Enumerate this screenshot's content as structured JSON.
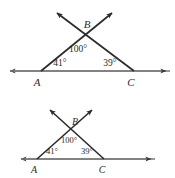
{
  "figures": [
    {
      "id": "figure-top",
      "name": "triangle-abc-large",
      "scale": "large",
      "vertices": {
        "A": "A",
        "B": "B",
        "C": "C"
      },
      "angles": {
        "at_A": "41°",
        "at_B": "100°",
        "at_C": "39°"
      },
      "geometry": {
        "A": [
          41,
          71
        ],
        "B": [
          85,
          33
        ],
        "C": [
          134,
          71
        ],
        "base_left_arrow_end": [
          6,
          71
        ],
        "base_right_arrow_end": [
          170,
          71
        ],
        "ray_up_left_end": [
          53,
          9
        ],
        "ray_up_right_end": [
          116,
          9
        ]
      },
      "label_positions": {
        "A": [
          37,
          85
        ],
        "B": [
          86,
          29
        ],
        "C": [
          130,
          85
        ],
        "angle_A": [
          58,
          64
        ],
        "angle_B": [
          75,
          52
        ],
        "angle_C": [
          108,
          64
        ]
      }
    },
    {
      "id": "figure-bottom",
      "name": "triangle-abc-small",
      "scale": "small",
      "vertices": {
        "A": "A",
        "B": "B",
        "C": "C"
      },
      "angles": {
        "at_A": "41°",
        "at_B": "100°",
        "at_C": "39°"
      },
      "geometry": {
        "A": [
          37,
          70
        ],
        "B": [
          72,
          41
        ],
        "C": [
          104,
          70
        ],
        "base_left_arrow_end": [
          17,
          70
        ],
        "base_right_arrow_end": [
          155,
          70
        ],
        "ray_up_left_end": [
          47,
          17
        ],
        "ray_up_right_end": [
          95,
          17
        ]
      },
      "label_positions": {
        "A": [
          34,
          83
        ],
        "B": [
          74,
          37
        ],
        "C": [
          101,
          83
        ],
        "angle_A": [
          51,
          63
        ],
        "angle_B": [
          66,
          53
        ],
        "angle_C": [
          85,
          63
        ]
      }
    }
  ],
  "style": {
    "stroke_color": "#2b2b2b",
    "base_line_color": "#7a7a7a",
    "text_color": "#2b2b2b",
    "background_color": "#ffffff"
  }
}
